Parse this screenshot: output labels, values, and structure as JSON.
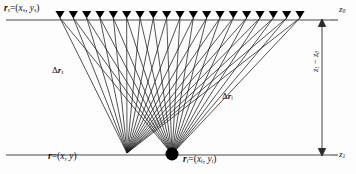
{
  "figure": {
    "type": "seismic-ray-geometry-diagram",
    "background_color": "#fdfdfd",
    "line_color": "#111111",
    "ray_color": "#1a1a1a",
    "marker_color": "#000000"
  },
  "labels": {
    "source_point": {
      "text": "r_s = (x_s , y_s)",
      "vec": "r",
      "sub": "s",
      "coords": "= (x",
      "coords_sub1": "s",
      "coords_mid": ", y",
      "coords_sub2": "s",
      "coords_end": ")"
    },
    "field_point": {
      "vec": "r",
      "sub": "",
      "rest": " = (x, y)"
    },
    "image_point": {
      "vec": "r",
      "sub": "i",
      "rest1": " = (x",
      "sub2": "i",
      "rest2": ", y",
      "sub3": "i",
      "rest3": ")"
    },
    "delta_left": {
      "delta": "Δ",
      "vec": "r",
      "sub": "s"
    },
    "delta_right": {
      "delta": "Δ",
      "vec": "r",
      "sub": "i"
    },
    "z_top": {
      "sym": "z",
      "sub": "0"
    },
    "z_bottom": {
      "sym": "z",
      "sub": "1"
    },
    "depth_span": {
      "numer": "z",
      "numer_sub": "1",
      "minus": " − ",
      "denom": "z",
      "denom_sub": "0"
    }
  },
  "geometry": {
    "top_line_y": 20,
    "bottom_line_y": 155,
    "line_x_start": 6,
    "line_x_end": 330,
    "receiver_count": 19,
    "receiver_x_first": 60,
    "receiver_x_last": 300,
    "receiver_y": 17,
    "fan_left_apex_x": 127,
    "fan_left_apex_y": 153,
    "fan_right_apex_x": 172,
    "fan_right_apex_y": 154,
    "dimension_arrow_x": 322,
    "image_marker_radius": 6.5
  },
  "axis": {
    "top_depth_label": "z0",
    "bottom_depth_label": "z1"
  }
}
